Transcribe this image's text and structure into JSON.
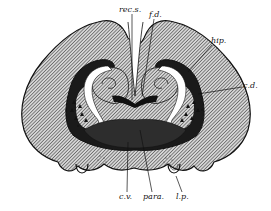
{
  "figure": {
    "colors": {
      "background": "#ffffff",
      "ink": "#111111",
      "hatch_fill": "#8a8a8a",
      "ventricle": "#ffffff"
    },
    "labels": [
      {
        "id": "rec-s",
        "text": "rec.s.",
        "x": 119,
        "y": 12
      },
      {
        "id": "f-d",
        "text": "f.d.",
        "x": 149,
        "y": 17
      },
      {
        "id": "hip",
        "text": "hip.",
        "x": 211,
        "y": 43
      },
      {
        "id": "c-d",
        "text": "c.d.",
        "x": 243,
        "y": 88
      },
      {
        "id": "c-v",
        "text": "c.v.",
        "x": 121,
        "y": 199
      },
      {
        "id": "para",
        "text": "para.",
        "x": 144,
        "y": 199
      },
      {
        "id": "l-p",
        "text": "l.p.",
        "x": 177,
        "y": 199
      }
    ]
  }
}
